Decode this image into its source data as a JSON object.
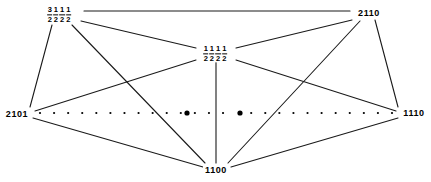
{
  "diagram": {
    "type": "graph-diagram",
    "width": 431,
    "height": 182,
    "background_color": "#ffffff",
    "line_color": "#1a1a1a",
    "dot_color": "#000000",
    "vertices": [
      {
        "id": "v-three-halves",
        "name": "three-halves-half-half-half",
        "kind": "fraction",
        "fractions": [
          {
            "num": "3",
            "den": "2"
          },
          {
            "num": "1",
            "den": "2"
          },
          {
            "num": "1",
            "den": "2"
          },
          {
            "num": "1",
            "den": "2"
          }
        ],
        "text": "3/2 1/2 1/2 1/2",
        "x": 59,
        "y": 15
      },
      {
        "id": "v-2110",
        "name": "vertex-2110",
        "kind": "plain",
        "text": "2110",
        "x": 369,
        "y": 13
      },
      {
        "id": "v-center",
        "name": "half-half-half-half",
        "kind": "fraction",
        "fractions": [
          {
            "num": "1",
            "den": "2"
          },
          {
            "num": "1",
            "den": "2"
          },
          {
            "num": "1",
            "den": "2"
          },
          {
            "num": "1",
            "den": "2"
          }
        ],
        "text": "1/2 1/2 1/2 1/2",
        "x": 215,
        "y": 54
      },
      {
        "id": "v-2101",
        "name": "vertex-2101",
        "kind": "plain",
        "text": "2101",
        "x": 17,
        "y": 114
      },
      {
        "id": "v-1110",
        "name": "vertex-1110",
        "kind": "plain",
        "text": "1110",
        "x": 414,
        "y": 113
      },
      {
        "id": "v-1100",
        "name": "vertex-1100",
        "kind": "plain",
        "text": "1100",
        "x": 216,
        "y": 170
      }
    ],
    "edges": [
      {
        "name": "edge-threehalves-2110",
        "from": "v-three-halves",
        "to": "v-2110",
        "x1": 84,
        "y1": 11,
        "x2": 350,
        "y2": 11
      },
      {
        "name": "edge-threehalves-center",
        "from": "v-three-halves",
        "to": "v-center",
        "x1": 81,
        "y1": 21,
        "x2": 196,
        "y2": 48
      },
      {
        "name": "edge-threehalves-2101",
        "from": "v-three-halves",
        "to": "v-2101",
        "x1": 52,
        "y1": 25,
        "x2": 30,
        "y2": 107
      },
      {
        "name": "edge-threehalves-1100",
        "from": "v-three-halves",
        "to": "v-1100",
        "x1": 72,
        "y1": 25,
        "x2": 205,
        "y2": 163
      },
      {
        "name": "edge-2110-center",
        "from": "v-2110",
        "to": "v-center",
        "x1": 352,
        "y1": 20,
        "x2": 236,
        "y2": 48
      },
      {
        "name": "edge-2110-1110",
        "from": "v-2110",
        "to": "v-1110",
        "x1": 375,
        "y1": 20,
        "x2": 398,
        "y2": 107
      },
      {
        "name": "edge-2110-1100",
        "from": "v-2110",
        "to": "v-1100",
        "x1": 360,
        "y1": 21,
        "x2": 228,
        "y2": 163
      },
      {
        "name": "edge-center-2101",
        "from": "v-center",
        "to": "v-2101",
        "x1": 196,
        "y1": 60,
        "x2": 35,
        "y2": 111
      },
      {
        "name": "edge-center-1110",
        "from": "v-center",
        "to": "v-1110",
        "x1": 236,
        "y1": 60,
        "x2": 396,
        "y2": 111
      },
      {
        "name": "edge-center-1100",
        "from": "v-center",
        "to": "v-1100",
        "x1": 216,
        "y1": 62,
        "x2": 216,
        "y2": 163
      },
      {
        "name": "edge-2101-1100",
        "from": "v-2101",
        "to": "v-1100",
        "x1": 33,
        "y1": 118,
        "x2": 203,
        "y2": 167
      },
      {
        "name": "edge-1110-1100",
        "from": "v-1110",
        "to": "v-1100",
        "x1": 398,
        "y1": 118,
        "x2": 231,
        "y2": 167
      }
    ],
    "dotted_line": {
      "name": "dotted-path-2101-1110",
      "y": 113,
      "x_start": 40,
      "x_end": 392,
      "small_dot_count": 26,
      "small_dot_radius": 1.1,
      "emphasized_dots": [
        {
          "name": "emphasized-dot-left",
          "x": 187,
          "y": 113,
          "r": 2.6
        },
        {
          "name": "emphasized-dot-right",
          "x": 240,
          "y": 113,
          "r": 2.6
        }
      ]
    }
  }
}
